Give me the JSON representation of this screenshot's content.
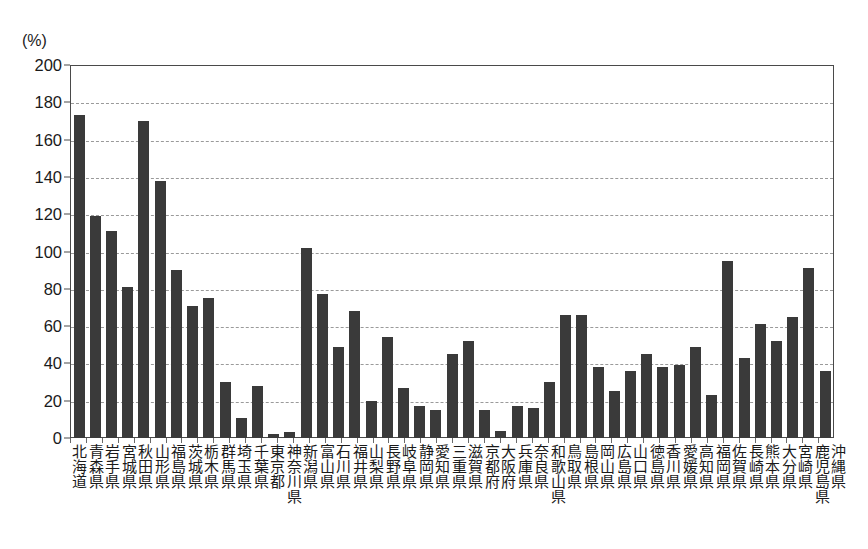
{
  "top_artifact_text": " ",
  "axis": {
    "unit_label": "(%)",
    "y_ticks": [
      "200",
      "180",
      "160",
      "140",
      "120",
      "100",
      "80",
      "60",
      "40",
      "20",
      "0"
    ]
  },
  "colors": {
    "bar": "#3a3a3a",
    "frame": "#4a4a4a",
    "gridline": "#9a9a9a",
    "background": "#ffffff",
    "text": "#1a1a1a"
  },
  "chart_data": {
    "type": "bar",
    "title": "",
    "xlabel": "",
    "ylabel": "(%)",
    "ylim": [
      0,
      200
    ],
    "ytick_step": 20,
    "grid": true,
    "legend": "none",
    "categories": [
      "北海道",
      "青森県",
      "岩手県",
      "宮城県",
      "秋田県",
      "山形県",
      "福島県",
      "茨城県",
      "栃木県",
      "群馬県",
      "埼玉県",
      "千葉県",
      "東京都",
      "神奈川県",
      "新潟県",
      "富山県",
      "石川県",
      "福井県",
      "山梨県",
      "長野県",
      "岐阜県",
      "静岡県",
      "愛知県",
      "三重県",
      "滋賀県",
      "京都府",
      "大阪府",
      "兵庫県",
      "奈良県",
      "和歌山県",
      "鳥取県",
      "島根県",
      "岡山県",
      "広島県",
      "山口県",
      "徳島県",
      "香川県",
      "愛媛県",
      "高知県",
      "福岡県",
      "佐賀県",
      "長崎県",
      "熊本県",
      "大分県",
      "宮崎県",
      "鹿児島県",
      "沖縄県"
    ],
    "values": [
      173,
      119,
      111,
      81,
      170,
      138,
      90,
      71,
      75,
      30,
      11,
      28,
      2,
      3,
      102,
      77,
      49,
      68,
      20,
      54,
      27,
      17,
      15,
      45,
      52,
      15,
      4,
      17,
      16,
      30,
      66,
      66,
      38,
      25,
      36,
      45,
      38,
      39,
      49,
      23,
      95,
      43,
      61,
      52,
      65,
      91,
      36
    ]
  }
}
